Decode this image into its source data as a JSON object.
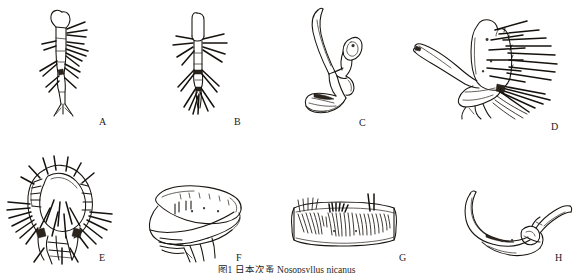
{
  "figure": {
    "kind": "scientific-line-drawing-plate",
    "background_color": "#ffffff",
    "ink_color": "#18140f",
    "width": 573,
    "height": 273,
    "rows": 2,
    "columns": 4,
    "caption": "图1 日本次蚤 Nosopsyllus nicanus",
    "caption_visible": "partially cut off at bottom edge"
  },
  "panels": [
    {
      "id": "A",
      "label": "A",
      "name": "panel-a-maxillary-palp",
      "description": "slender elongate appendage with lateral spines and bristles, tapering distally",
      "label_x": 99,
      "label_y": 117
    },
    {
      "id": "B",
      "label": "B",
      "name": "panel-b-labial-palp",
      "description": "narrow segmented appendage bearing long radiating setae",
      "label_x": 234,
      "label_y": 117
    },
    {
      "id": "C",
      "label": "C",
      "name": "panel-c-aedeagus",
      "description": "curved sclerotised rod with hooked apex and basal plate",
      "label_x": 359,
      "label_y": 118
    },
    {
      "id": "D",
      "label": "D",
      "name": "panel-d-clasper",
      "description": "broad rounded lobe densely fringed with long bristles, with slender basal process",
      "label_x": 551,
      "label_y": 122
    },
    {
      "id": "E",
      "label": "E",
      "name": "panel-e-head-capsule",
      "description": "rounded head capsule with ctenidium and numerous radiating setae",
      "label_x": 99,
      "label_y": 253
    },
    {
      "id": "F",
      "label": "F",
      "name": "panel-f-sternite",
      "description": "smooth lobed plate with fine internal markings and ventral processes",
      "label_x": 236,
      "label_y": 253
    },
    {
      "id": "G",
      "label": "G",
      "name": "panel-g-spermatheca-plate",
      "description": "elongate rectangular sclerite covered with dense short setae along dorsal margin",
      "label_x": 399,
      "label_y": 253
    },
    {
      "id": "H",
      "label": "H",
      "name": "panel-h-manubrium",
      "description": "slender curved falciform structure with articulated distal arm",
      "label_x": 555,
      "label_y": 253
    }
  ]
}
